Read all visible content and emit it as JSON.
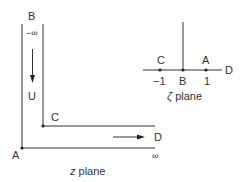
{
  "z_plane": {
    "title_var": "z",
    "title_rest": " plane",
    "labels": {
      "B": "B",
      "minus_infinity": "−∞",
      "U": "U",
      "C": "C",
      "D": "D",
      "A": "A",
      "infinity": "∞"
    }
  },
  "zeta_plane": {
    "title_var": "ζ",
    "title_rest": " plane",
    "points": [
      {
        "name": "C",
        "value": "−1"
      },
      {
        "name": "B",
        "value": "B"
      },
      {
        "name": "A",
        "value": "1"
      }
    ],
    "D": "D"
  },
  "colors": {
    "line": "#333333",
    "background": "#ffffff"
  }
}
